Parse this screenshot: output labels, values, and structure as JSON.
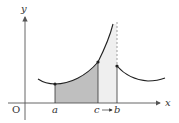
{
  "diagram": {
    "type": "function-graph",
    "axes": {
      "x_label": "x",
      "y_label": "y",
      "origin_label": "O"
    },
    "points": {
      "a": "a",
      "c_to_b": "c→b",
      "c": "c",
      "arrow": "→",
      "b": "b"
    },
    "colors": {
      "curve": "#222222",
      "axis": "#555555",
      "shade_dark": "#bdbdbd",
      "shade_light": "#ececec",
      "dashed": "#888888"
    }
  }
}
